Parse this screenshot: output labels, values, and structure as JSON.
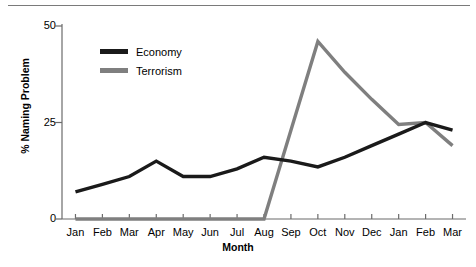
{
  "chart_data": {
    "type": "line",
    "title": "",
    "xlabel": "Month",
    "ylabel": "% Naming Problem",
    "categories": [
      "Jan",
      "Feb",
      "Mar",
      "Apr",
      "May",
      "Jun",
      "Jul",
      "Aug",
      "Sep",
      "Oct",
      "Nov",
      "Dec",
      "Jan",
      "Feb",
      "Mar"
    ],
    "yticks": [
      0,
      25,
      50
    ],
    "ytick_labels": [
      "0",
      "25",
      "50"
    ],
    "ylim": [
      0,
      50
    ],
    "grid": false,
    "legend_position": "upper-left-inside",
    "series": [
      {
        "name": "Economy",
        "color": "#1a1a1a",
        "values": [
          7,
          9,
          11,
          15,
          11,
          11,
          13,
          16,
          15,
          13.5,
          16,
          19,
          22,
          25,
          23
        ]
      },
      {
        "name": "Terrorism",
        "color": "#7f7f7f",
        "values": [
          0,
          0,
          0,
          0,
          0,
          0,
          0,
          0,
          23,
          46,
          38,
          31,
          24.5,
          25,
          19
        ]
      }
    ]
  },
  "legend": {
    "items": [
      {
        "label": "Economy",
        "swatch_name": "legend-swatch-economy"
      },
      {
        "label": "Terrorism",
        "swatch_name": "legend-swatch-terrorism"
      }
    ]
  },
  "colors": {
    "economy": "#1a1a1a",
    "terrorism": "#7f7f7f",
    "axis": "#6b6b6b",
    "rule": "#7a7a7a",
    "background": "#ffffff"
  }
}
